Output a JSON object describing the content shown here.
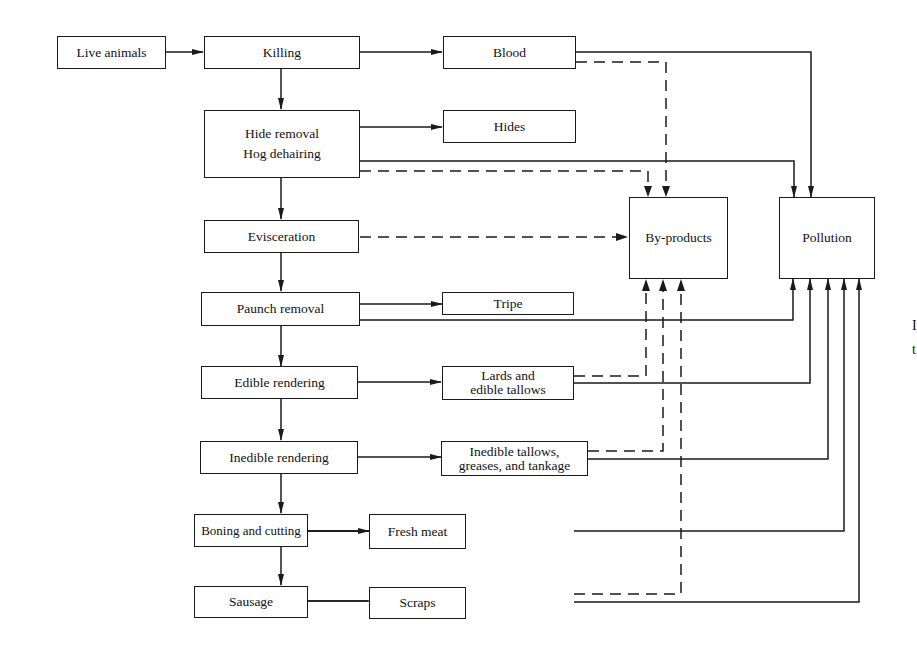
{
  "diagram": {
    "type": "flowchart",
    "nodes": {
      "live_animals": "Live animals",
      "killing": "Killing",
      "blood": "Blood",
      "hide_removal_1": "Hide removal",
      "hide_removal_2": "Hog dehairing",
      "hides": "Hides",
      "evisceration": "Evisceration",
      "byproducts": "By-products",
      "pollution": "Pollution",
      "paunch_removal": "Paunch removal",
      "tripe": "Tripe",
      "edible_rendering": "Edible rendering",
      "lards_1": "Lards and",
      "lards_2": "edible tallows",
      "inedible_rendering": "Inedible rendering",
      "inedible_tallows_1": "Inedible tallows,",
      "inedible_tallows_2": "greases, and tankage",
      "boning": "Boning and cutting",
      "fresh_meat": "Fresh meat",
      "sausage": "Sausage",
      "scraps": "Scraps"
    },
    "edge_text": [
      "I",
      "t"
    ],
    "edges": [
      {
        "from": "Live animals",
        "to": "Killing",
        "style": "solid"
      },
      {
        "from": "Killing",
        "to": "Blood",
        "style": "solid"
      },
      {
        "from": "Killing",
        "to": "Hide removal / Hog dehairing",
        "style": "solid"
      },
      {
        "from": "Hide removal / Hog dehairing",
        "to": "Hides",
        "style": "solid"
      },
      {
        "from": "Hide removal / Hog dehairing",
        "to": "Evisceration",
        "style": "solid"
      },
      {
        "from": "Evisceration",
        "to": "Paunch removal",
        "style": "solid"
      },
      {
        "from": "Paunch removal",
        "to": "Tripe",
        "style": "solid"
      },
      {
        "from": "Paunch removal",
        "to": "Edible rendering",
        "style": "solid"
      },
      {
        "from": "Edible rendering",
        "to": "Lards and edible tallows",
        "style": "solid"
      },
      {
        "from": "Edible rendering",
        "to": "Inedible rendering",
        "style": "solid"
      },
      {
        "from": "Inedible rendering",
        "to": "Inedible tallows, greases, and tankage",
        "style": "solid"
      },
      {
        "from": "Inedible rendering",
        "to": "Boning and cutting",
        "style": "solid"
      },
      {
        "from": "Boning and cutting",
        "to": "Fresh meat",
        "style": "solid"
      },
      {
        "from": "Boning and cutting",
        "to": "Sausage",
        "style": "solid"
      },
      {
        "from": "Sausage",
        "to": "Scraps",
        "style": "solid"
      },
      {
        "from": "Blood",
        "to": "Pollution",
        "style": "solid"
      },
      {
        "from": "Blood",
        "to": "By-products",
        "style": "dashed"
      },
      {
        "from": "Hide removal / Hog dehairing",
        "to": "Pollution",
        "style": "solid"
      },
      {
        "from": "Hide removal / Hog dehairing",
        "to": "By-products",
        "style": "dashed"
      },
      {
        "from": "Evisceration",
        "to": "By-products",
        "style": "dashed"
      },
      {
        "from": "Paunch removal",
        "to": "Pollution",
        "style": "solid"
      },
      {
        "from": "Lards and edible tallows",
        "to": "By-products",
        "style": "dashed"
      },
      {
        "from": "Lards and edible tallows",
        "to": "Pollution",
        "style": "solid"
      },
      {
        "from": "Inedible tallows, greases, and tankage",
        "to": "By-products",
        "style": "dashed"
      },
      {
        "from": "Inedible tallows, greases, and tankage",
        "to": "Pollution",
        "style": "solid"
      },
      {
        "from": "Fresh meat",
        "to": "Pollution",
        "style": "solid"
      },
      {
        "from": "Scraps",
        "to": "By-products",
        "style": "dashed"
      },
      {
        "from": "Scraps",
        "to": "Pollution",
        "style": "solid"
      }
    ]
  }
}
